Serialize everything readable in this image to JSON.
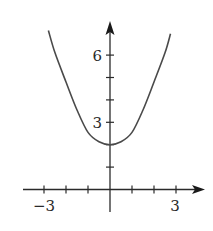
{
  "chart_data": {
    "type": "line",
    "title": "",
    "xlabel": "",
    "ylabel": "",
    "xlim": [
      -3.0,
      4.0
    ],
    "ylim": [
      -1.0,
      7.5
    ],
    "grid": false,
    "legend": null,
    "x_ticks": [
      -3,
      -2,
      -1,
      0,
      1,
      2,
      3
    ],
    "y_ticks": [
      1,
      2,
      3,
      4,
      5,
      6
    ],
    "x_tick_labels": [
      {
        "value": -3,
        "label": "−3"
      },
      {
        "value": 3,
        "label": "3"
      }
    ],
    "y_tick_labels": [
      {
        "value": 3,
        "label": "3"
      },
      {
        "value": 6,
        "label": "6"
      }
    ],
    "series": [
      {
        "name": "curve",
        "description": "symmetric U-shaped curve, minimum at (0, 2)",
        "x": [
          -2.8,
          -2.5,
          -2.0,
          -1.5,
          -1.0,
          -0.5,
          0,
          0.5,
          1.0,
          1.5,
          2.0,
          2.5,
          2.75
        ],
        "y": [
          7.1,
          6.1,
          4.8,
          3.55,
          2.55,
          2.13,
          2.0,
          2.13,
          2.55,
          3.55,
          4.8,
          6.1,
          6.95
        ]
      }
    ],
    "vertex": {
      "x": 0,
      "y": 2
    }
  },
  "labels": {
    "x_neg3": "−3",
    "x_3": "3",
    "y_3": "3",
    "y_6": "6"
  }
}
